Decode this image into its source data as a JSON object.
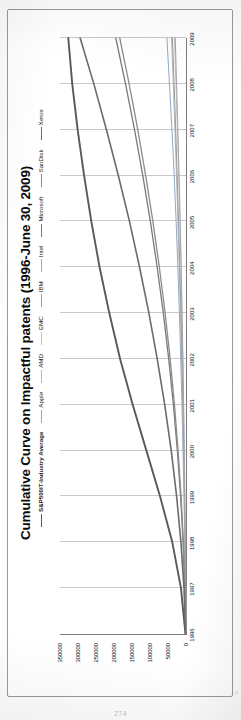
{
  "document": {
    "page_number": "274"
  },
  "chart_data": {
    "type": "line",
    "title": "Cumulative Curve on Impactful patents (1996-June 30, 2009)",
    "xlabel": "",
    "ylabel": "",
    "grid": true,
    "legend_position": "top-right",
    "ylim": [
      0,
      350000
    ],
    "yticks": [
      "0",
      "50000",
      "100000",
      "150000",
      "200000",
      "250000",
      "300000",
      "350000"
    ],
    "ytick_values": [
      0,
      50000,
      100000,
      150000,
      200000,
      250000,
      300000,
      350000
    ],
    "x": [
      "1996",
      "1997",
      "1998",
      "1999",
      "2000",
      "2001",
      "2002",
      "2003",
      "2004",
      "2005",
      "2006",
      "2007",
      "2008",
      "2009"
    ],
    "series": [
      {
        "name": "S&P500IT-Industry Average",
        "color": "#595959",
        "width": 1.9,
        "values": [
          1500,
          14000,
          38000,
          72000,
          110000,
          148000,
          183000,
          213000,
          240000,
          263000,
          283000,
          301000,
          316000,
          327000
        ]
      },
      {
        "name": "Apple",
        "color": "#8fa8c8",
        "width": 1.0,
        "values": [
          400,
          1600,
          3400,
          5600,
          8200,
          11200,
          14600,
          18400,
          22600,
          27400,
          32800,
          39000,
          46000,
          53000
        ]
      },
      {
        "name": "AMD",
        "color": "#b8b8b8",
        "width": 1.0,
        "values": [
          300,
          1300,
          2900,
          4800,
          7000,
          9500,
          12300,
          15400,
          18800,
          22500,
          26500,
          30800,
          35400,
          40200
        ]
      },
      {
        "name": "EMC",
        "color": "#c3c3c3",
        "width": 1.0,
        "values": [
          200,
          900,
          2000,
          3400,
          5000,
          6900,
          9000,
          11400,
          14100,
          17100,
          20400,
          24000,
          27900,
          32100
        ]
      },
      {
        "name": "IBM",
        "color": "#9c9c9c",
        "width": 1.0,
        "values": [
          250,
          1100,
          2500,
          4200,
          6200,
          8500,
          11100,
          14000,
          17200,
          20700,
          24500,
          28600,
          33000,
          37700
        ]
      },
      {
        "name": "Intel",
        "color": "#a6a6a6",
        "width": 1.0,
        "values": [
          200,
          850,
          1900,
          3200,
          4700,
          6500,
          8500,
          10800,
          13300,
          16100,
          19200,
          22500,
          26100,
          30000
        ]
      },
      {
        "name": "Microsoft",
        "color": "#7a7a7a",
        "width": 1.3,
        "values": [
          600,
          3200,
          8000,
          15000,
          24000,
          35000,
          48000,
          63000,
          80000,
          99000,
          120000,
          143000,
          168000,
          195000
        ]
      },
      {
        "name": "SanDisk",
        "color": "#8c8c8c",
        "width": 1.3,
        "values": [
          500,
          2800,
          7200,
          13600,
          22000,
          32000,
          44000,
          58000,
          74000,
          92000,
          112000,
          134000,
          158000,
          184000
        ]
      },
      {
        "name": "Xerox",
        "color": "#6b6b6b",
        "width": 1.6,
        "values": [
          900,
          5600,
          14000,
          26000,
          41000,
          59000,
          80000,
          103000,
          129000,
          157000,
          188000,
          221000,
          256000,
          294000
        ]
      }
    ]
  }
}
